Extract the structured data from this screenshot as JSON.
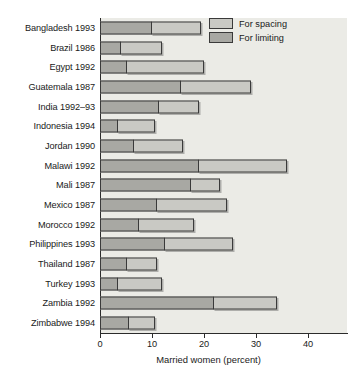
{
  "chart_data": {
    "type": "bar",
    "orientation": "horizontal",
    "stacked": true,
    "title": "",
    "xlabel": "Married women (percent)",
    "ylabel": "",
    "xlim": [
      0,
      47.5
    ],
    "xticks": [
      0,
      10,
      20,
      30,
      40
    ],
    "xticklabels": [
      "0",
      "10",
      "20",
      "30",
      "40"
    ],
    "grid": false,
    "legend_position": "top-right",
    "categories": [
      "Bangladesh 1993",
      "Brazil 1986",
      "Egypt 1992",
      "Guatemala 1987",
      "India 1992–93",
      "Indonesia 1994",
      "Jordan 1990",
      "Malawi 1992",
      "Mali 1987",
      "Mexico 1987",
      "Morocco 1992",
      "Philippines 1993",
      "Thailand 1987",
      "Turkey 1993",
      "Zambia 1992",
      "Zimbabwe 1994"
    ],
    "series": [
      {
        "name": "For limiting",
        "color": "#a8a8a3",
        "values": [
          10.0,
          4.0,
          5.2,
          15.5,
          11.3,
          3.5,
          6.5,
          19.0,
          17.5,
          11.0,
          7.5,
          12.5,
          5.2,
          3.5,
          22.0,
          5.5
        ]
      },
      {
        "name": "For spacing",
        "color": "#c9c9c4",
        "values": [
          9.5,
          8.0,
          14.8,
          13.5,
          7.7,
          7.0,
          9.5,
          17.0,
          5.5,
          13.5,
          10.5,
          13.0,
          5.8,
          8.5,
          12.0,
          5.0
        ]
      }
    ],
    "totals": [
      19.5,
      12.0,
      20.0,
      29.0,
      19.0,
      10.5,
      16.0,
      36.0,
      23.0,
      24.5,
      18.0,
      25.5,
      11.0,
      12.0,
      34.0,
      10.5
    ]
  },
  "legend": {
    "items": [
      {
        "label": "For spacing",
        "swatch": "spacing-swatch"
      },
      {
        "label": "For limiting",
        "swatch": "limiting-swatch"
      }
    ]
  },
  "colors": {
    "plot_background": "#ebebe6",
    "axis": "#2b2b2b",
    "spacing": "#c9c9c4",
    "limiting": "#a8a8a3",
    "page_background": "#ffffff"
  }
}
